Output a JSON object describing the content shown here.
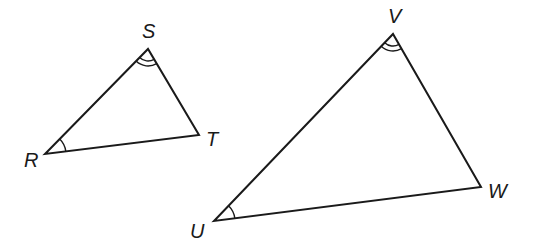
{
  "diagram": {
    "type": "similar-triangles",
    "colors": {
      "stroke": "#1a1a1a",
      "background": "#ffffff"
    },
    "triangles": [
      {
        "name": "RST",
        "vertices": {
          "R": {
            "label": "R",
            "x": 45,
            "y": 154
          },
          "S": {
            "label": "S",
            "x": 148,
            "y": 49
          },
          "T": {
            "label": "T",
            "x": 199,
            "y": 135
          }
        },
        "angle_marks": [
          {
            "vertex": "R",
            "arcs": 1
          },
          {
            "vertex": "S",
            "arcs": 2
          }
        ]
      },
      {
        "name": "UVW",
        "vertices": {
          "U": {
            "label": "U",
            "x": 214,
            "y": 221
          },
          "V": {
            "label": "V",
            "x": 393,
            "y": 34
          },
          "W": {
            "label": "W",
            "x": 481,
            "y": 187
          }
        },
        "angle_marks": [
          {
            "vertex": "U",
            "arcs": 1
          },
          {
            "vertex": "V",
            "arcs": 2
          }
        ]
      }
    ],
    "labels": {
      "R": "R",
      "S": "S",
      "T": "T",
      "U": "U",
      "V": "V",
      "W": "W"
    }
  }
}
